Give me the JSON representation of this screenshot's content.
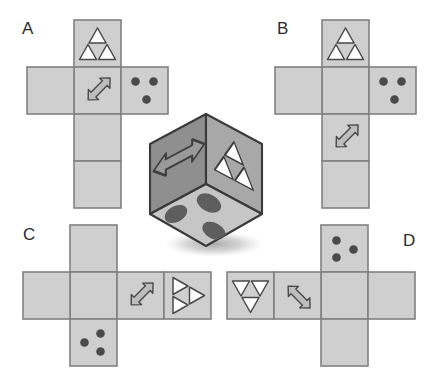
{
  "figure": {
    "background_color": "#ffffff"
  },
  "palette": {
    "net_face_fill": "#cfcfcf",
    "net_face_stroke": "#808080",
    "cube_face_left": "#8f8f8f",
    "cube_face_right": "#a8a8a8",
    "cube_face_bottom": "#c6c6c6",
    "cube_edge": "#3a3a3a",
    "symbol_outline": "#4a4a4a",
    "symbol_fill": "#bdbdbd",
    "pip_fill": "#4a4a4a",
    "cube_pip_fill": "#5e5e5e",
    "triangle_fill": "#ffffff",
    "shadow": "#b0b0b0",
    "label_color": "#2b2b2b"
  },
  "symbols": {
    "triangle": {
      "name": "triangle-motif",
      "description": "Outlined equilateral triangle subdivided into three white corner triangles around an inverted centre triangle"
    },
    "arrow": {
      "name": "double-arrow-motif",
      "description": "Double-headed diagonal arrow with grey fill and dark outline"
    },
    "pips": {
      "name": "three-pip-motif",
      "description": "Three dark round pips arranged two on top and one below",
      "count": 3
    }
  },
  "cube": {
    "name": "three-dimensional-die",
    "faces": [
      {
        "position": "left",
        "symbol": "double-arrow-motif",
        "orientation": "horizontal double arrow"
      },
      {
        "position": "right",
        "symbol": "triangle-motif",
        "orientation": "skewed upright triangle"
      },
      {
        "position": "bottom-front",
        "symbol": "three-pip-motif",
        "pip_count": 3
      }
    ],
    "has_shadow": true
  },
  "options": [
    {
      "id": "A",
      "label": "A",
      "name": "option-a",
      "layout": "vertical column of four squares with a horizontal row of three crossing at the second square",
      "faces": [
        {
          "cell": "column-row-1",
          "symbol": "triangle-motif",
          "orientation": "upright"
        },
        {
          "cell": "column-row-2",
          "symbol": "double-arrow-motif",
          "orientation": "up-right / down-left"
        },
        {
          "cell": "row-right",
          "symbol": "three-pip-motif",
          "pip_count": 3
        },
        {
          "cell": "row-left",
          "symbol": "none"
        },
        {
          "cell": "column-row-3",
          "symbol": "none"
        },
        {
          "cell": "column-row-4",
          "symbol": "none"
        }
      ]
    },
    {
      "id": "B",
      "label": "B",
      "name": "option-b",
      "layout": "vertical column of four squares with a horizontal row of three crossing at the second square",
      "faces": [
        {
          "cell": "column-row-1",
          "symbol": "triangle-motif",
          "orientation": "upright"
        },
        {
          "cell": "column-row-3",
          "symbol": "double-arrow-motif",
          "orientation": "up-right / down-left"
        },
        {
          "cell": "row-right",
          "symbol": "three-pip-motif",
          "pip_count": 3
        },
        {
          "cell": "row-left",
          "symbol": "none"
        },
        {
          "cell": "column-row-2",
          "symbol": "none"
        },
        {
          "cell": "column-row-4",
          "symbol": "none"
        }
      ]
    },
    {
      "id": "C",
      "label": "C",
      "name": "option-c",
      "layout": "horizontal row of four squares with a vertical column of three crossing at the second square",
      "faces": [
        {
          "cell": "row-col-3",
          "symbol": "double-arrow-motif",
          "orientation": "up-right / down-left"
        },
        {
          "cell": "row-col-4",
          "symbol": "triangle-motif",
          "orientation": "rotated ninety degrees, pointing right"
        },
        {
          "cell": "column-below",
          "symbol": "three-pip-motif",
          "pip_count": 3
        },
        {
          "cell": "row-col-1",
          "symbol": "none"
        },
        {
          "cell": "row-col-2",
          "symbol": "none"
        },
        {
          "cell": "column-above",
          "symbol": "none"
        }
      ]
    },
    {
      "id": "D",
      "label": "D",
      "name": "option-d",
      "layout": "horizontal row of four squares with a vertical column of three crossing at the third square",
      "faces": [
        {
          "cell": "row-col-1",
          "symbol": "triangle-motif",
          "orientation": "inverted, pointing down"
        },
        {
          "cell": "row-col-2",
          "symbol": "double-arrow-motif",
          "orientation": "up-right / down-left"
        },
        {
          "cell": "column-above",
          "symbol": "three-pip-motif",
          "pip_count": 3
        },
        {
          "cell": "row-col-3",
          "symbol": "none"
        },
        {
          "cell": "row-col-4",
          "symbol": "none"
        },
        {
          "cell": "column-below",
          "symbol": "none"
        }
      ]
    }
  ],
  "labels": {
    "a": "A",
    "b": "B",
    "c": "C",
    "d": "D"
  }
}
